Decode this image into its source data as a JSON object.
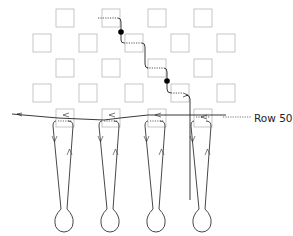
{
  "diagram": {
    "type": "stitch-path-schematic",
    "row_label": "Row 50",
    "colors": {
      "grid_square": "#b5b5b5",
      "path": "#222222",
      "dotted": "#555555",
      "node": "#000000",
      "background": "#ffffff"
    },
    "grid": {
      "square_size": 18,
      "rows": [
        {
          "y": 9,
          "x": [
            56,
            102,
            148,
            194
          ]
        },
        {
          "y": 34,
          "x": [
            33,
            79,
            125,
            171,
            217
          ]
        },
        {
          "y": 59,
          "x": [
            56,
            102,
            148,
            194
          ]
        },
        {
          "y": 84,
          "x": [
            33,
            79,
            125,
            171,
            217
          ]
        },
        {
          "y": 109,
          "x": [
            56,
            102,
            148,
            194
          ],
          "label": "Row 50"
        }
      ]
    },
    "nodes": [
      {
        "x": 121,
        "y": 32
      },
      {
        "x": 167,
        "y": 81
      }
    ],
    "loops": [
      {
        "cx": 64,
        "top": 130,
        "bulb_cy": 221
      },
      {
        "cx": 110,
        "top": 130,
        "bulb_cy": 221
      },
      {
        "cx": 156,
        "top": 130,
        "bulb_cy": 221
      },
      {
        "cx": 202,
        "top": 130,
        "bulb_cy": 221
      }
    ]
  }
}
